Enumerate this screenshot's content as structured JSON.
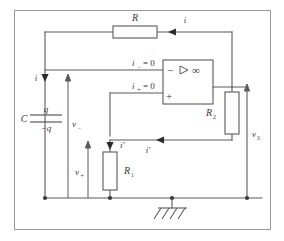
{
  "figure": {
    "kind": "circuit-diagram",
    "width": 284,
    "height": 241,
    "line_color": "#5a5a5a",
    "border_color": "#8a8a8a",
    "text_color": "#3a3a3a",
    "background": "#ffffff"
  },
  "components": {
    "feedback_resistor": {
      "label": "R",
      "orientation": "horizontal"
    },
    "input_capacitor": {
      "label": "C",
      "top_plate_charge": "q",
      "bottom_plate_charge": "−q"
    },
    "lower_resistor": {
      "label": "R",
      "sub": "1",
      "orientation": "vertical"
    },
    "source_resistor": {
      "label": "R",
      "sub": "2",
      "orientation": "vertical"
    },
    "opamp": {
      "inverting_terminal": "−",
      "noninverting_terminal": "+",
      "gain_symbol": "∞",
      "triangle_marker": "▷"
    },
    "ground": {
      "symbol": "chassis-ground"
    }
  },
  "labels": {
    "current_input": "i",
    "current_feedback": "i",
    "current_inverting_input": "i",
    "current_inverting_input_sub": "−",
    "current_inverting_input_value": "= 0",
    "current_noninverting_input": "i",
    "current_noninverting_input_sub": "+",
    "current_noninverting_input_value": "= 0",
    "current_prime_top": "i′",
    "current_prime_mid": "i′",
    "voltage_minus": "v",
    "voltage_minus_sub": "−",
    "voltage_plus": "v",
    "voltage_plus_sub": "+",
    "voltage_source": "v",
    "voltage_source_sub": "S"
  }
}
